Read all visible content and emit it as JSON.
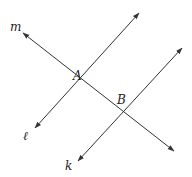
{
  "diagram": {
    "lines": [
      {
        "name": "m",
        "x1": 23,
        "y1": 33,
        "x2": 174,
        "y2": 151
      },
      {
        "name": "ℓ",
        "x1": 139,
        "y1": 13,
        "x2": 35,
        "y2": 128
      },
      {
        "name": "k",
        "x1": 182,
        "y1": 48,
        "x2": 78,
        "y2": 161
      }
    ],
    "labels": {
      "m": "m",
      "l": "ℓ",
      "k": "k",
      "A": "A",
      "B": "B"
    },
    "points": {
      "A": {
        "x": 80,
        "y": 79
      },
      "B": {
        "x": 123,
        "y": 113
      }
    },
    "stroke_color": "#333333"
  }
}
